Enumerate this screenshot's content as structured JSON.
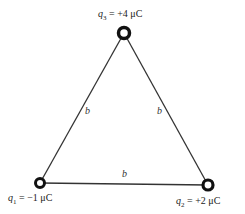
{
  "diagram": {
    "type": "equilateral triangle of point charges",
    "side_label": "b",
    "charges": [
      {
        "id": "q1",
        "symbol": "q",
        "subscript": "1",
        "value": "= −1 μC",
        "position": "bottom-left"
      },
      {
        "id": "q2",
        "symbol": "q",
        "subscript": "2",
        "value": "= +2 μC",
        "position": "bottom-right"
      },
      {
        "id": "q3",
        "symbol": "q",
        "subscript": "3",
        "value": "= +4 μC",
        "position": "top"
      }
    ],
    "sides": [
      {
        "between": "q1-q3",
        "label": "b"
      },
      {
        "between": "q2-q3",
        "label": "b"
      },
      {
        "between": "q1-q2",
        "label": "b"
      }
    ]
  }
}
